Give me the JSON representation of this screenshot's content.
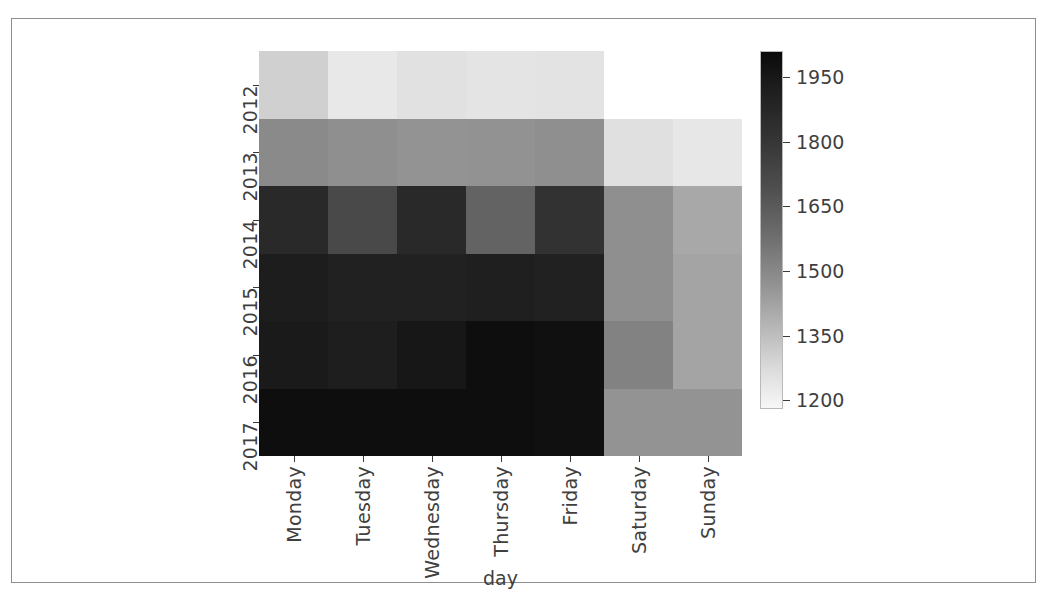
{
  "chart_data": {
    "type": "heatmap",
    "title": "",
    "xlabel": "day",
    "ylabel": "",
    "grid": false,
    "colormap": "Greys (dark = high)",
    "x_categories": [
      "Monday",
      "Tuesday",
      "Wednesday",
      "Thursday",
      "Friday",
      "Saturday",
      "Sunday"
    ],
    "y_categories": [
      "2012",
      "2013",
      "2014",
      "2015",
      "2016",
      "2017"
    ],
    "colorbar": {
      "ticks": [
        1950,
        1800,
        1650,
        1500,
        1350,
        1200
      ],
      "tick_labels": [
        "1950",
        "1800",
        "1650",
        "1500",
        "1350",
        "1200"
      ],
      "vmin": 1180,
      "vmax": 2010,
      "position": "right",
      "orientation": "vertical"
    },
    "rows": [
      {
        "label": "2012",
        "values": [
          1300,
          1225,
          1255,
          1240,
          1245,
          null,
          null
        ],
        "colors": [
          "#d0d0d0",
          "#e8e8e8",
          "#e1e1e1",
          "#e4e4e4",
          "#e3e3e3",
          "#ffffff",
          "#ffffff"
        ]
      },
      {
        "label": "2013",
        "values": [
          1560,
          1545,
          1530,
          1535,
          1545,
          1260,
          1235
        ]
      },
      {
        "label": "2014",
        "values": [
          1900,
          1790,
          1900,
          1700,
          1870,
          1545,
          1455
        ]
      },
      {
        "label": "2015",
        "values": [
          1945,
          1930,
          1930,
          1935,
          1930,
          1545,
          1470
        ]
      },
      {
        "label": "2016",
        "values": [
          1955,
          1940,
          1965,
          1995,
          1990,
          1590,
          1470
        ]
      },
      {
        "label": "2017",
        "values": [
          1995,
          1995,
          1995,
          1995,
          1990,
          1530,
          1530
        ]
      }
    ],
    "missing_cells": [
      {
        "row": "2012",
        "column": "Saturday"
      },
      {
        "row": "2012",
        "column": "Sunday"
      }
    ]
  },
  "axes": {
    "x_label": "day",
    "x_ticks": [
      "Monday",
      "Tuesday",
      "Wednesday",
      "Thursday",
      "Friday",
      "Saturday",
      "Sunday"
    ],
    "y_ticks": [
      "2012",
      "2013",
      "2014",
      "2015",
      "2016",
      "2017"
    ]
  },
  "colorbar_ticks": [
    "1950",
    "1800",
    "1650",
    "1500",
    "1350",
    "1200"
  ]
}
